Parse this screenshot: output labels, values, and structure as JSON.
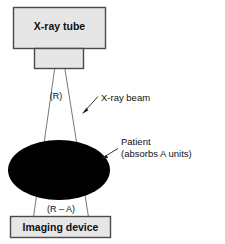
{
  "diagram": {
    "type": "schematic",
    "colors": {
      "box_fill": "#e6e6e6",
      "box_stroke": "#4a4a4a",
      "patient_fill": "#000000",
      "line_stroke": "#555555",
      "text": "#111111",
      "background": "#ffffff"
    },
    "source": {
      "tube_label": "X-ray tube",
      "collimator_label": ""
    },
    "beam": {
      "intensity_label": "(R)",
      "callout_label": "X-ray beam"
    },
    "patient": {
      "label_line1": "Patient",
      "label_line2": "(absorbs A units)"
    },
    "detector": {
      "transmitted_label": "(R – A)",
      "device_label": "Imaging device"
    }
  }
}
